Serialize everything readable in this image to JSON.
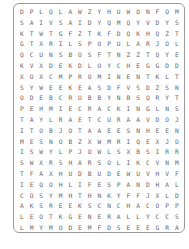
{
  "puzzle": {
    "rows": [
      "DPLQLAWZYHUWONFQM",
      "SAIVSAIDYQMQYVDYS",
      "KTWTGFZTKFDQKHQZT",
      "GTXRILSPOPULARJOL",
      "QCUNSBOSFTNZZTQYE",
      "KVXDEKDLOYCHEGGDD",
      "XOXCMPROMINENTKLT",
      "SYWEEKEASDFVSDZSN",
      "ODEBCRUBBYNBSQRYT",
      "PEHMIECRACKINGLNS",
      "TAYLRAETCURAAVDOJ",
      "ITOBJOTAAEESNHEEN",
      "MESNOBZXWMRIQEXJO",
      "ISWYLPJOWLSXBSIRR",
      "SWXRSHARSOLIKCVNM",
      "TFAXHUDBUDEWUVHVF",
      "IEQOHLIFESPANDHAL",
      "COSYMHTHNKYFFJXLD",
      "AKSREEKSCNCHACOPP",
      "LEOTKGENERALLYCCS",
      "LMYMODEMFDSEEEGRA"
    ],
    "word_list": [
      "POPULAR",
      "PROMINENT",
      "WEEKEAS",
      "CRUBBY",
      "CRACKING",
      "JOWLS",
      "LIFESPAN",
      "GENERALLY",
      "COPPERS",
      "CONTOURED",
      "CREEK",
      "BLUNT",
      "DEBIRCSED"
    ]
  }
}
